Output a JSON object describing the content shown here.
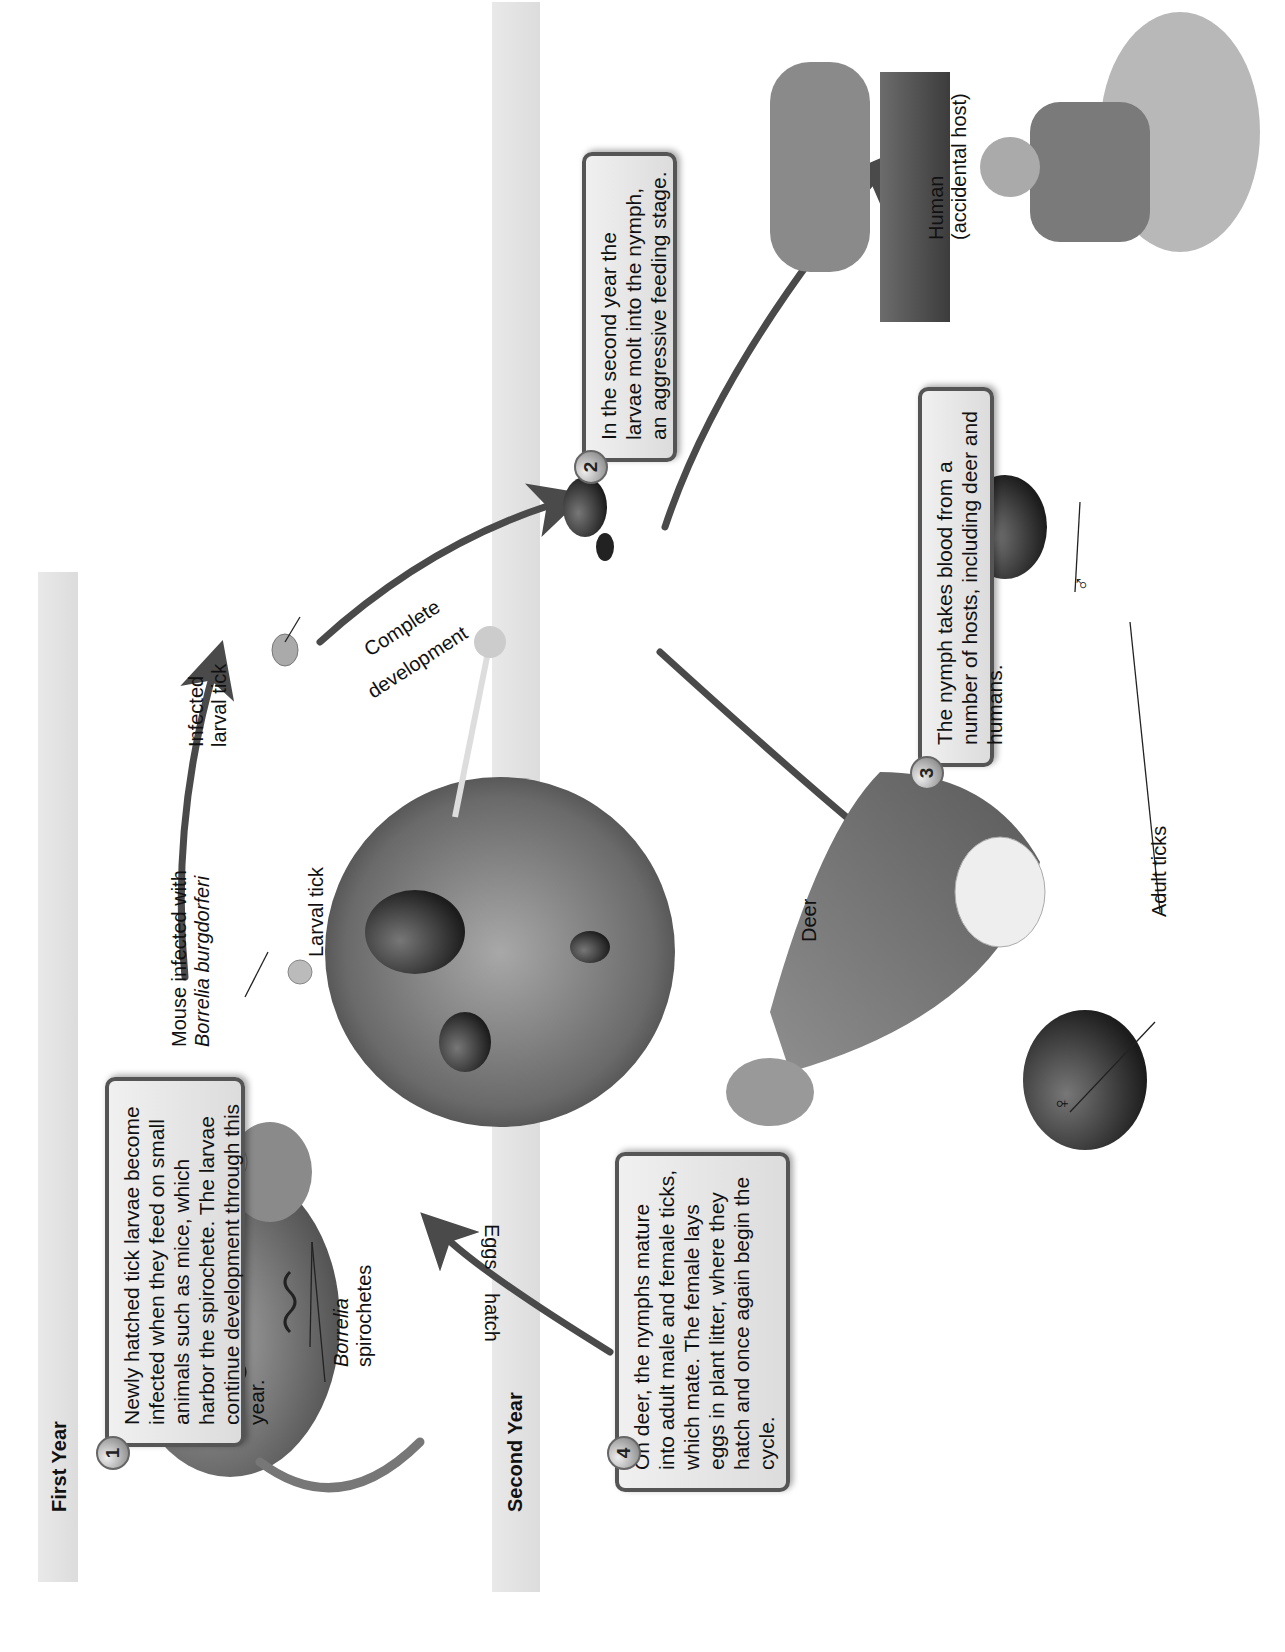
{
  "figure": {
    "orientation": "rotated 90 degrees counter-clockwise",
    "bands": {
      "first_year": "First Year",
      "second_year": "Second Year"
    },
    "steps": [
      {
        "number": "1",
        "text": "Newly hatched tick larvae become infected when they feed on small animals such as mice, which harbor the spirochete. The larvae continue development through this year."
      },
      {
        "number": "2",
        "text": "In the second year the larvae molt into the nymph, an aggressive feeding stage."
      },
      {
        "number": "3",
        "text": "The nymph takes blood from a number of hosts, including deer and humans."
      },
      {
        "number": "4",
        "text": "On deer, the nymphs mature into adult male and female ticks, which mate. The female lays eggs in plant litter, where they hatch and once again begin the cycle."
      }
    ],
    "labels": {
      "mouse_line1": "Mouse infected with",
      "mouse_line2_italic": "Borrelia burgdorferi",
      "larval_tick": "Larval tick",
      "infected_larval_line1": "Infected",
      "infected_larval_line2": "larval tick",
      "complete": "Complete",
      "development": "development",
      "human_line1": "Human",
      "human_line2": "(accidental host)",
      "deer": "Deer",
      "adult_ticks": "Adult ticks",
      "male_symbol": "♂",
      "female_symbol": "♀",
      "borrelia_italic": "Borrelia",
      "spirochetes": "spirochetes",
      "eggs": "Eggs",
      "hatch": "hatch"
    },
    "colors": {
      "arrow": "#4a4a4a",
      "box_border": "#555555",
      "band": "#e2e2e2"
    }
  }
}
